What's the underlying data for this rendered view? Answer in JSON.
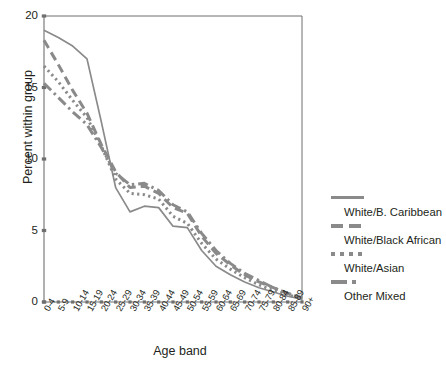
{
  "chart_data": {
    "type": "line",
    "title": "",
    "xlabel": "Age band",
    "ylabel": "Percent within group",
    "ylim": [
      0,
      20
    ],
    "yticks": [
      0,
      5,
      10,
      15,
      20
    ],
    "grid": false,
    "legend_position": "right",
    "categories": [
      "0-4",
      "5-9",
      "10-14",
      "15-19",
      "20-24",
      "25-29",
      "30-34",
      "35-39",
      "40-44",
      "45-49",
      "50-54",
      "55-59",
      "60-64",
      "65-69",
      "70-74",
      "75-79",
      "80-84",
      "85-89",
      "90+"
    ],
    "series": [
      {
        "name": "White/B. Caribbean",
        "style": "solid",
        "values": [
          19.0,
          18.5,
          17.9,
          17.0,
          12.6,
          8.0,
          6.3,
          6.7,
          6.6,
          5.3,
          5.2,
          3.6,
          2.5,
          1.9,
          1.4,
          1.0,
          0.7,
          0.4,
          0.2
        ]
      },
      {
        "name": "White/Black African",
        "style": "dashed",
        "values": [
          18.3,
          16.6,
          14.8,
          13.2,
          11.0,
          9.1,
          8.0,
          8.1,
          7.6,
          6.6,
          6.2,
          4.6,
          3.4,
          2.6,
          1.9,
          1.4,
          1.0,
          0.6,
          0.3
        ]
      },
      {
        "name": "White/Asian",
        "style": "dotted",
        "values": [
          16.5,
          15.4,
          14.1,
          12.9,
          10.9,
          8.6,
          7.6,
          7.5,
          7.2,
          6.0,
          5.5,
          4.1,
          3.0,
          2.3,
          1.7,
          1.2,
          0.8,
          0.5,
          0.25
        ]
      },
      {
        "name": "Other Mixed",
        "style": "dashdot",
        "values": [
          15.3,
          14.3,
          13.3,
          12.4,
          10.8,
          9.0,
          8.2,
          8.3,
          7.8,
          6.8,
          6.3,
          4.8,
          3.6,
          2.7,
          2.0,
          1.5,
          1.0,
          0.6,
          0.3
        ]
      }
    ]
  },
  "axis": {
    "y_tick_labels": [
      "0",
      "5",
      "10",
      "15",
      "20"
    ],
    "y_title": "Percent within group",
    "x_title": "Age band"
  },
  "legend": {
    "items": [
      {
        "label": "White/B. Caribbean",
        "style": "solid"
      },
      {
        "label": "White/Black African",
        "style": "dashed"
      },
      {
        "label": "White/Asian",
        "style": "dotted"
      },
      {
        "label": "Other Mixed",
        "style": "dashdot"
      }
    ]
  },
  "colors": {
    "line": "#8a8a8a",
    "axis": "#6f6f6f",
    "text": "#231f20",
    "background": "#ffffff"
  }
}
